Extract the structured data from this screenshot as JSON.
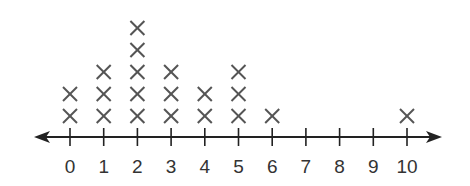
{
  "chart_data": {
    "type": "line-plot",
    "subtype": "dot plot with X marks",
    "title": "",
    "xlabel": "",
    "ylabel": "",
    "categories": [
      0,
      1,
      2,
      3,
      4,
      5,
      6,
      7,
      8,
      9,
      10
    ],
    "values": [
      2,
      3,
      5,
      3,
      2,
      3,
      1,
      0,
      0,
      0,
      1
    ],
    "tick_labels": [
      "0",
      "1",
      "2",
      "3",
      "4",
      "5",
      "6",
      "7",
      "8",
      "9",
      "10"
    ],
    "marker": "X",
    "xlim": [
      0,
      10
    ],
    "axis_arrows": "both",
    "grid": false,
    "legend": null,
    "colors": {
      "axis": "#222222",
      "marker": "#555555",
      "label": "#333333"
    }
  }
}
